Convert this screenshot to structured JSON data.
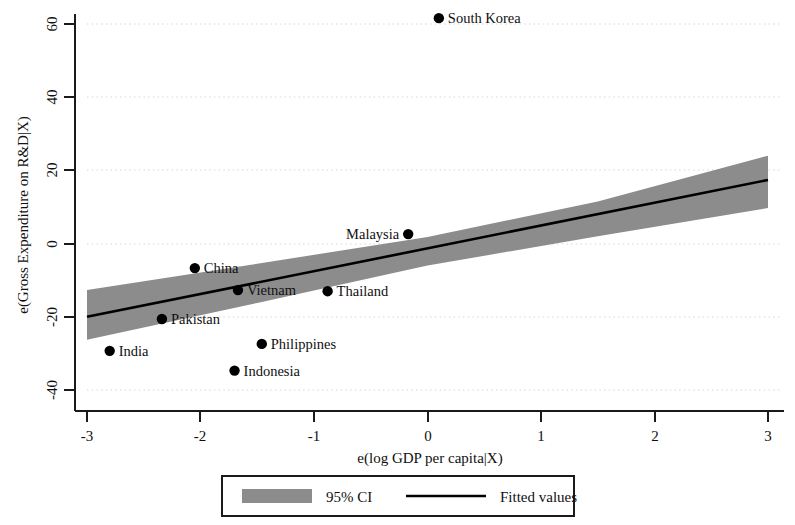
{
  "chart_data": {
    "type": "scatter",
    "title": "",
    "xlabel": "e(log GDP per capita|X)",
    "ylabel": "e(Gross Expenditure on R&D|X)",
    "xlim": [
      -3,
      3
    ],
    "ylim": [
      -40,
      65
    ],
    "xticks": [
      -3,
      -2,
      -1,
      0,
      1,
      2,
      3
    ],
    "xtick_labels": [
      "-3",
      "-2",
      "-1",
      "0",
      "1",
      "2",
      "3"
    ],
    "yticks": [
      -40,
      -20,
      0,
      20,
      40,
      60
    ],
    "ytick_labels": [
      "-40",
      "-20",
      "0",
      "20",
      "40",
      "60"
    ],
    "grid": "horizontal-dotted",
    "legend_position": "below-plot",
    "points": [
      {
        "label": "South Korea",
        "x": 0.1,
        "y": 61.6,
        "label_side": "right"
      },
      {
        "label": "Malaysia",
        "x": -0.17,
        "y": 2.6,
        "label_side": "left"
      },
      {
        "label": "China",
        "x": -2.05,
        "y": -6.7,
        "label_side": "right"
      },
      {
        "label": "Vietnam",
        "x": -1.67,
        "y": -12.7,
        "label_side": "right"
      },
      {
        "label": "Thailand",
        "x": -0.88,
        "y": -13.0,
        "label_side": "right"
      },
      {
        "label": "Pakistan",
        "x": -2.34,
        "y": -20.6,
        "label_side": "right"
      },
      {
        "label": "Philippines",
        "x": -1.46,
        "y": -27.4,
        "label_side": "right"
      },
      {
        "label": "India",
        "x": -2.8,
        "y": -29.3,
        "label_side": "right"
      },
      {
        "label": "Indonesia",
        "x": -1.7,
        "y": -34.7,
        "label_side": "right"
      }
    ],
    "series": [
      {
        "name": "Fitted values",
        "type": "line",
        "x": [
          -3,
          3
        ],
        "values": [
          -20.0,
          17.4
        ]
      },
      {
        "name": "95% CI",
        "type": "band",
        "x": [
          -3,
          -1.5,
          0,
          1.5,
          3
        ],
        "upper": [
          -12.7,
          -5.5,
          1.8,
          11.5,
          24.0
        ],
        "lower": [
          -26.3,
          -16.2,
          -6.0,
          2.0,
          9.7
        ]
      }
    ],
    "legend": [
      {
        "key": "ci-swatch",
        "label": "95% CI",
        "marker": "filled-rect",
        "color": "#8c8c8c"
      },
      {
        "key": "fit-line",
        "label": "Fitted values",
        "marker": "line",
        "color": "#000000"
      }
    ],
    "colors": {
      "point": "#000000",
      "fit_line": "#000000",
      "ci_band": "#8c8c8c",
      "axis": "#1a1a1a",
      "grid": "#d9d9d9",
      "background": "#ffffff"
    }
  }
}
